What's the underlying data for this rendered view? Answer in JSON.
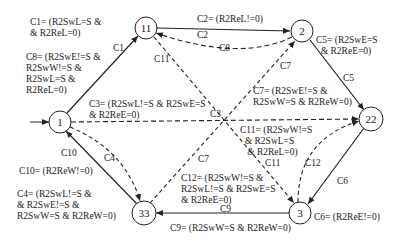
{
  "diagram": {
    "type": "state-machine",
    "nodes": [
      {
        "id": "11",
        "x": 146,
        "y": 28
      },
      {
        "id": "2",
        "x": 302,
        "y": 31
      },
      {
        "id": "1",
        "x": 60,
        "y": 122
      },
      {
        "id": "22",
        "x": 371,
        "y": 119
      },
      {
        "id": "33",
        "x": 144,
        "y": 213
      },
      {
        "id": "3",
        "x": 300,
        "y": 213
      }
    ],
    "edges": [
      {
        "id": "C1",
        "from": "1",
        "to": "11",
        "style": "solid"
      },
      {
        "id": "C2",
        "from": "11",
        "to": "2",
        "style": "solid"
      },
      {
        "id": "C3",
        "from": "1",
        "to": "22",
        "style": "dashed"
      },
      {
        "id": "C4",
        "from": "1",
        "to": "33",
        "style": "dashed"
      },
      {
        "id": "C5",
        "from": "2",
        "to": "22",
        "style": "solid"
      },
      {
        "id": "C6",
        "from": "22",
        "to": "3",
        "style": "solid"
      },
      {
        "id": "C7",
        "from": "33",
        "to": "2",
        "style": "dashed"
      },
      {
        "id": "C8",
        "from": "2",
        "to": "11",
        "style": "dashed"
      },
      {
        "id": "C9",
        "from": "3",
        "to": "33",
        "style": "solid"
      },
      {
        "id": "C10",
        "from": "33",
        "to": "1",
        "style": "solid"
      },
      {
        "id": "C11",
        "from": "11",
        "to": "3",
        "style": "dashed"
      },
      {
        "id": "C12",
        "from": "3",
        "to": "22",
        "style": "dashed"
      }
    ],
    "edge_labels": {
      "C1": "C1",
      "C2": "C2",
      "C3": "C3",
      "C4": "C4",
      "C5": "C5",
      "C6": "C6",
      "C7": "C7",
      "C8": "C8",
      "C9": "C9",
      "C10": "C10",
      "C11": "C11",
      "C12": "C12"
    },
    "conditions": {
      "C1": "C1= (R2SwL=S &\n& R2ReL=0)",
      "C2": "C2= (R2ReL!=0)",
      "C3": "C3= (R2SwL!=S & R2SwE=S\n& R2ReE=0)",
      "C4": "C4= (R2SwL!=S &\n& R2SwE!=S &\nR2SwW=S & R2ReW=0)",
      "C5": "C5= (R2SwE=S\n  & R2ReE=0)",
      "C6": "C6= (R2ReE!=0)",
      "C7": "C7= (R2SwE!=S &\nR2SwW=S & R2ReW=0)",
      "C8": "C8= (R2SwE!=S &\nR2SwW!=S &\nR2SwL=S &\nR2ReL=0)",
      "C9": "C9= (R2SwW=S & R2ReW=0)",
      "C10": "C10= (R2ReW!=0)",
      "C11": "C11= (R2SwW!=S\n  & R2SwL=S\n   & R2ReL=0)",
      "C12": "C12= (R2SwW!=S &\nR2SwL!=S & R2SwE=S\n& R2ReE=0)"
    }
  }
}
